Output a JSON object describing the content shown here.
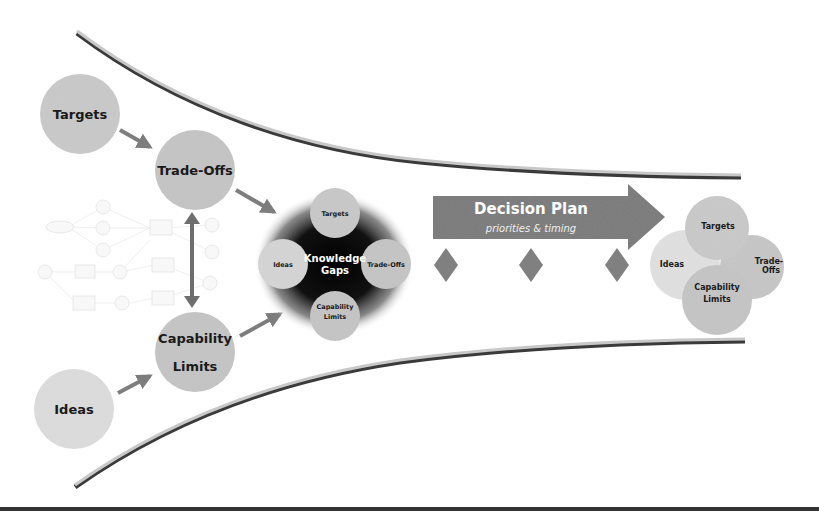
{
  "diagram": {
    "colors": {
      "circle_medium": "#c4c4c4",
      "circle_light": "#d9d9d9",
      "arrow_gray": "#7d7d7d",
      "decision_arrow": "#7a7a7a",
      "diamond": "#808080",
      "funnel_light": "#c8c8c8",
      "funnel_dark": "#3a3a3a",
      "knowledge_gaps_bg": "#0a0a0a",
      "baseline": "#333333"
    },
    "inputs": {
      "targets": "Targets",
      "trade_offs": "Trade-Offs",
      "capability_limits_line1": "Capability",
      "capability_limits_line2": "Limits",
      "ideas": "Ideas"
    },
    "knowledge_gaps": {
      "title_line1": "Knowledge",
      "title_line2": "Gaps",
      "targets": "Targets",
      "ideas": "Ideas",
      "trade_offs": "Trade-Offs",
      "capability_line1": "Capability",
      "capability_line2": "Limits"
    },
    "decision_plan": {
      "title": "Decision Plan",
      "subtitle": "priorities & timing",
      "milestones": 3
    },
    "outcome": {
      "targets": "Targets",
      "trade_offs_line1": "Trade-",
      "trade_offs_line2": "Offs",
      "ideas": "Ideas",
      "capability_line1": "Capability",
      "capability_line2": "Limits"
    },
    "mini_diagram": {
      "description": "illegible embedded trade-off network diagram"
    }
  }
}
